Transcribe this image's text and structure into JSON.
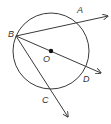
{
  "diagram": {
    "type": "circle-geometry",
    "circle": {
      "center_label": "O",
      "center": [
        51,
        51
      ],
      "radius": 38
    },
    "points": {
      "A": {
        "label": "A",
        "x": 79,
        "y": 21,
        "label_x": 77,
        "label_y": 13
      },
      "B": {
        "label": "B",
        "x": 16,
        "y": 36,
        "label_x": 9,
        "label_y": 36
      },
      "C": {
        "label": "C",
        "x": 49,
        "y": 89,
        "label_x": 42,
        "label_y": 102
      },
      "D": {
        "label": "D",
        "x": 85,
        "y": 71,
        "label_x": 83,
        "label_y": 81
      },
      "O": {
        "label": "O",
        "x": 51,
        "y": 51,
        "label_x": 43,
        "label_y": 62
      }
    },
    "rays": [
      {
        "name": "ray-BA",
        "from": "B",
        "through": "A",
        "end": [
          108,
          16
        ]
      },
      {
        "name": "ray-BD",
        "from": "B",
        "through": "D",
        "end": [
          101,
          73
        ]
      },
      {
        "name": "ray-BC",
        "from": "B",
        "through": "C",
        "end": [
          68,
          117
        ]
      }
    ],
    "colors": {
      "stroke": "#3a3a3a",
      "background": "#ffffff"
    }
  }
}
